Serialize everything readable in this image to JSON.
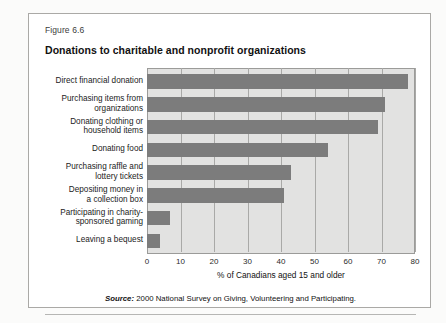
{
  "figure": {
    "number": "Figure 6.6",
    "title": "Donations to charitable and nonprofit organizations",
    "source_prefix": "Source:",
    "source_text": " 2000 National Survey on Giving, Volunteering and Participating."
  },
  "colors": {
    "bar": "#7c7c7c",
    "plot_background": "#e2e2e1",
    "gridline": "#a9a9a7",
    "frame": "#aaa9a6",
    "text": "#111111"
  },
  "chart_data": {
    "type": "bar",
    "orientation": "horizontal",
    "title": "Donations to charitable and nonprofit organizations",
    "xlabel": "% of Canadians aged 15 and older",
    "ylabel": "",
    "xlim": [
      0,
      80
    ],
    "xticks": [
      0,
      10,
      20,
      30,
      40,
      50,
      60,
      70,
      80
    ],
    "xtick_labels": [
      "0",
      "10",
      "20",
      "30",
      "40",
      "50",
      "60",
      "70",
      "80"
    ],
    "grid": true,
    "legend": null,
    "categories": [
      "Direct financial donation",
      "Purchasing items from organizations",
      "Donating clothing or household items",
      "Donating food",
      "Purchasing raffle and lottery tickets",
      "Depositing money in a collection box",
      "Participating in charity-sponsored gaming",
      "Leaving a bequest"
    ],
    "category_lines": [
      [
        "Direct financial donation"
      ],
      [
        "Purchasing items from",
        "organizations"
      ],
      [
        "Donating clothing or",
        "household items"
      ],
      [
        "Donating food"
      ],
      [
        "Purchasing raffle and",
        "lottery tickets"
      ],
      [
        "Depositing money in",
        "a collection box"
      ],
      [
        "Participating in charity-",
        "sponsored gaming"
      ],
      [
        "Leaving a bequest"
      ]
    ],
    "values": [
      78,
      71,
      69,
      54,
      43,
      41,
      7,
      4
    ],
    "value_unit": "%"
  }
}
